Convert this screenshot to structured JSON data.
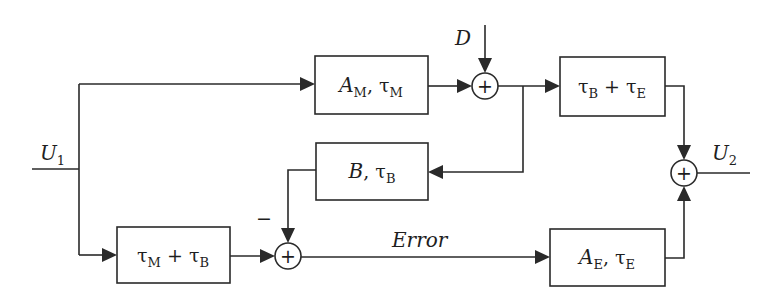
{
  "diagram": {
    "type": "block-diagram",
    "inputs": {
      "u1": {
        "main": "U",
        "sub": "1"
      },
      "d": "D"
    },
    "outputs": {
      "u2": {
        "main": "U",
        "sub": "2"
      }
    },
    "blocks": {
      "a_m": {
        "p1": "A",
        "p1_sub": "M",
        "sep": ", ",
        "p2": "τ",
        "p2_sub": "M"
      },
      "tb_te": {
        "p1": "τ",
        "p1_sub": "B",
        "sep": " + ",
        "p2": "τ",
        "p2_sub": "E"
      },
      "b_tb": {
        "p1": "B",
        "p1_sub": "",
        "sep": ", ",
        "p2": "τ",
        "p2_sub": "B"
      },
      "tm_tb": {
        "p1": "τ",
        "p1_sub": "M",
        "sep": " + ",
        "p2": "τ",
        "p2_sub": "B"
      },
      "a_e": {
        "p1": "A",
        "p1_sub": "E",
        "sep": ", ",
        "p2": "τ",
        "p2_sub": "E"
      }
    },
    "summing_junctions": {
      "sum1_symbol": "+",
      "sum2_symbol": "+",
      "sum3_symbol": "+"
    },
    "signal_labels": {
      "error": "Error",
      "minus_sign": "−"
    }
  }
}
